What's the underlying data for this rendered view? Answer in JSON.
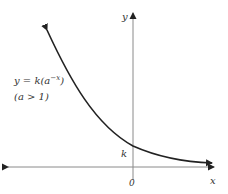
{
  "diagram": {
    "type": "function-graph",
    "axes": {
      "x_label": "x",
      "y_label": "y",
      "origin_label": "0"
    },
    "curve": {
      "equation_prefix": "y = k(a",
      "equation_exponent": "−x",
      "equation_suffix": ")",
      "condition": "(a > 1)",
      "intercept_label": "k",
      "description": "Exponential decay curve y = k·a^(−x), decreasing from upper left, crossing the y-axis at k, approaching the x-axis asymptotically to the right"
    },
    "colors": {
      "axis": "#8a8a8a",
      "curve": "#222222",
      "text": "#333333"
    }
  }
}
